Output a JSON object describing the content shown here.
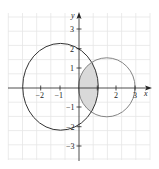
{
  "figure": {
    "type": "polar-region-diagram",
    "axes": {
      "x_label": "x",
      "y_label": "y",
      "x_ticks": [
        "−2",
        "−1",
        "2",
        "3"
      ],
      "x_tick_values": [
        -2,
        -1,
        2,
        3
      ],
      "y_ticks": [
        "3",
        "2",
        "1",
        "−1",
        "−2",
        "−3"
      ],
      "y_tick_values": [
        3,
        2,
        1,
        -1,
        -2,
        -3
      ],
      "grid": true
    },
    "curves": [
      {
        "name": "large-circle",
        "center": [
          -1,
          0
        ],
        "passes_through": [
          [
            -3,
            0
          ],
          [
            1,
            0
          ],
          [
            0,
            2
          ],
          [
            0,
            -2
          ]
        ],
        "color": "#333333"
      },
      {
        "name": "small-circle",
        "center": [
          1.5,
          0
        ],
        "radius": 1.5,
        "color": "#777777"
      }
    ],
    "shaded_region": {
      "description": "intersection of the two circles",
      "fill": "#d9d9d9"
    },
    "colors": {
      "grid": "#e6e6e6",
      "axis": "#222222"
    }
  }
}
